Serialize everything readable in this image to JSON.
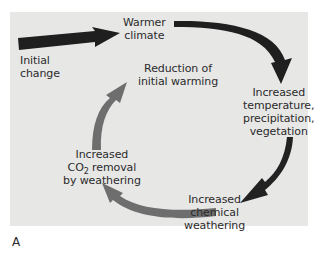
{
  "diagram": {
    "panel_color": "#e7e7e6",
    "dark_arrow_color": "#1f1f1f",
    "gray_arrow_color": "#6e6e6e",
    "nodes": [
      {
        "id": "initial_change",
        "line1": "Initial",
        "line2": "change"
      },
      {
        "id": "warmer_climate",
        "line1": "Warmer",
        "line2": "climate"
      },
      {
        "id": "increased_temp",
        "line1": "Increased",
        "line2": "temperature,",
        "line3": "precipitation,",
        "line4": "vegetation"
      },
      {
        "id": "increased_chem",
        "line1": "Increased",
        "line2": "chemical",
        "line3": "weathering"
      },
      {
        "id": "increased_co2",
        "line1": "Increased",
        "line2_prefix": "CO",
        "line2_sub": "2",
        "line2_suffix": " removal",
        "line3": "by weathering"
      },
      {
        "id": "reduction",
        "line1": "Reduction of",
        "line2": "initial warming"
      }
    ],
    "edges": [
      {
        "from": "initial_change",
        "to": "warmer_climate",
        "style": "dark"
      },
      {
        "from": "warmer_climate",
        "to": "increased_temp",
        "style": "dark"
      },
      {
        "from": "increased_temp",
        "to": "increased_chem",
        "style": "dark"
      },
      {
        "from": "increased_chem",
        "to": "increased_co2",
        "style": "gray"
      },
      {
        "from": "increased_co2",
        "to": "reduction",
        "style": "gray"
      }
    ],
    "figure_label": "A"
  }
}
